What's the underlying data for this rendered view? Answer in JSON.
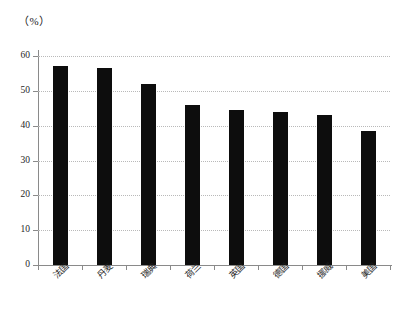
{
  "chart_data": {
    "type": "bar",
    "title": "",
    "unit_label": "（%）",
    "xlabel": "",
    "ylabel": "",
    "ylim": [
      0,
      60
    ],
    "grid": true,
    "legend": "none",
    "categories": [
      "法国",
      "丹麦",
      "瑞典",
      "荷兰",
      "英国",
      "德国",
      "挪威",
      "美国"
    ],
    "values": [
      57,
      56.5,
      52,
      46,
      44.5,
      44,
      43,
      38.5
    ],
    "ytick_labels": [
      "0",
      "10",
      "20",
      "30",
      "40",
      "50",
      "60"
    ],
    "ytick_values": [
      0,
      10,
      20,
      30,
      40,
      50,
      60
    ],
    "bar_color": "#0d0d0d",
    "grid_color": "#b9b9b9",
    "axis_color": "#8a8a8a"
  }
}
